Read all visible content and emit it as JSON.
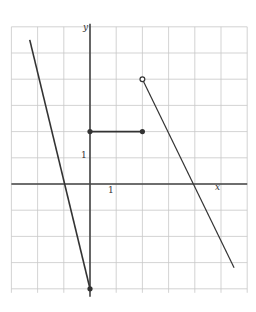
{
  "graph": {
    "title": "",
    "axis_labels": {
      "x": "x",
      "y": "y"
    },
    "tick_labels": {
      "x_unit": "1",
      "y_unit": "1"
    },
    "origin_px": [
      90,
      184
    ],
    "unit_px": 26.2,
    "x_range": [
      -3,
      6
    ],
    "y_range": [
      -4,
      6
    ],
    "colors": {
      "grid": "#c8c8c8",
      "axis": "#444444",
      "curve": "#333333"
    }
  },
  "chart_data": {
    "type": "line",
    "title": "",
    "xlabel": "x",
    "ylabel": "y",
    "xlim": [
      -3,
      6
    ],
    "ylim": [
      -4,
      6
    ],
    "grid": true,
    "series": [
      {
        "name": "piece-1",
        "points": [
          [
            -2.3,
            5.5
          ],
          [
            0,
            -4
          ]
        ],
        "endpoints": [
          "none",
          "closed"
        ]
      },
      {
        "name": "piece-2",
        "points": [
          [
            0,
            2
          ],
          [
            2,
            2
          ]
        ],
        "endpoints": [
          "closed",
          "closed"
        ]
      },
      {
        "name": "piece-3",
        "points": [
          [
            2,
            4
          ],
          [
            5.5,
            -3.2
          ]
        ],
        "endpoints": [
          "open",
          "none"
        ]
      }
    ],
    "annotations": [
      "1 (x-axis unit)",
      "1 (y-axis unit)"
    ]
  }
}
